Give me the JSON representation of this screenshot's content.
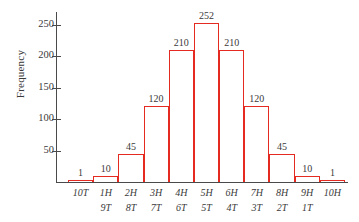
{
  "chart_data": {
    "type": "bar",
    "title": "",
    "subtitle": "",
    "xlabel": "",
    "ylabel": "Frequency",
    "categories": [
      "10T",
      "1H",
      "2H",
      "3H",
      "4H",
      "5H",
      "6H",
      "7H",
      "8H",
      "9H",
      "10H"
    ],
    "categories_secondary": [
      "",
      "9T",
      "8T",
      "7T",
      "6T",
      "5T",
      "4T",
      "3T",
      "2T",
      "1T",
      ""
    ],
    "values": [
      1,
      10,
      45,
      120,
      210,
      252,
      210,
      120,
      45,
      10,
      1
    ],
    "data_labels": [
      "1",
      "10",
      "45",
      "120",
      "210",
      "252",
      "210",
      "120",
      "45",
      "10",
      "1"
    ],
    "ylim": [
      0,
      270
    ],
    "yticks": [
      50,
      100,
      150,
      200,
      250
    ],
    "ytick_labels": [
      "50",
      "100",
      "150",
      "200",
      "250"
    ],
    "grid": false,
    "legend": false,
    "legend_position": "none",
    "bar_style": "outline",
    "colors": {
      "bar_outline": "#e52a22",
      "bar_fill": "transparent",
      "axis": "#4a4a4a",
      "text": "#3a3a3a",
      "background": "#ffffff"
    }
  }
}
